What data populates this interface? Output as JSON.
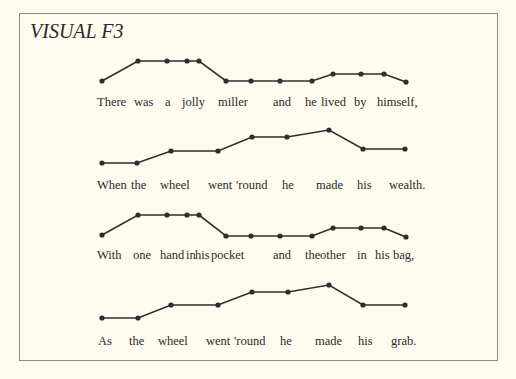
{
  "title": "VISUAL F3",
  "colors": {
    "background": "#fdfbed",
    "line": "#2e2e2e",
    "text": "#2b2b2b",
    "border": "#8a8a80"
  },
  "lines": [
    {
      "words": [
        {
          "text": "There",
          "x": 97
        },
        {
          "text": "was",
          "x": 134
        },
        {
          "text": "a",
          "x": 165
        },
        {
          "text": "jolly",
          "x": 182
        },
        {
          "text": "miller",
          "x": 218
        },
        {
          "text": "and",
          "x": 273
        },
        {
          "text": "he",
          "x": 305
        },
        {
          "text": "lived",
          "x": 321
        },
        {
          "text": "by",
          "x": 354
        },
        {
          "text": "himself,",
          "x": 377
        }
      ],
      "text_y": 95,
      "points": [
        [
          102,
          81
        ],
        [
          138,
          61
        ],
        [
          167,
          61
        ],
        [
          187,
          61
        ],
        [
          199,
          61
        ],
        [
          226,
          81
        ],
        [
          251,
          81
        ],
        [
          280,
          81
        ],
        [
          312,
          81
        ],
        [
          333,
          74
        ],
        [
          361,
          74
        ],
        [
          384,
          74
        ],
        [
          406,
          82
        ]
      ]
    },
    {
      "words": [
        {
          "text": "When",
          "x": 97
        },
        {
          "text": "the",
          "x": 131
        },
        {
          "text": "wheel",
          "x": 160
        },
        {
          "text": "went",
          "x": 208
        },
        {
          "text": "'round",
          "x": 236
        },
        {
          "text": "he",
          "x": 282
        },
        {
          "text": "made",
          "x": 316
        },
        {
          "text": "his",
          "x": 357
        },
        {
          "text": "wealth.",
          "x": 389
        }
      ],
      "text_y": 178,
      "points": [
        [
          102,
          163
        ],
        [
          137,
          163
        ],
        [
          171,
          151
        ],
        [
          218,
          151
        ],
        [
          252,
          137
        ],
        [
          287,
          137
        ],
        [
          329,
          130
        ],
        [
          363,
          149
        ],
        [
          405,
          149
        ]
      ]
    },
    {
      "words": [
        {
          "text": "With",
          "x": 97
        },
        {
          "text": "one",
          "x": 133
        },
        {
          "text": "hand",
          "x": 160
        },
        {
          "text": "in",
          "x": 186
        },
        {
          "text": "his",
          "x": 195
        },
        {
          "text": "pocket",
          "x": 211
        },
        {
          "text": "and",
          "x": 273
        },
        {
          "text": "the",
          "x": 305
        },
        {
          "text": "other",
          "x": 320
        },
        {
          "text": "in",
          "x": 357
        },
        {
          "text": "his",
          "x": 375
        },
        {
          "text": "bag,",
          "x": 393
        }
      ],
      "text_y": 248,
      "points": [
        [
          102,
          235
        ],
        [
          138,
          215
        ],
        [
          167,
          215
        ],
        [
          187,
          215
        ],
        [
          199,
          215
        ],
        [
          226,
          236
        ],
        [
          251,
          236
        ],
        [
          280,
          236
        ],
        [
          312,
          236
        ],
        [
          333,
          228
        ],
        [
          361,
          228
        ],
        [
          384,
          228
        ],
        [
          406,
          237
        ]
      ]
    },
    {
      "words": [
        {
          "text": "As",
          "x": 98
        },
        {
          "text": "the",
          "x": 129
        },
        {
          "text": "wheel",
          "x": 158
        },
        {
          "text": "went",
          "x": 206
        },
        {
          "text": "'round",
          "x": 234
        },
        {
          "text": "he",
          "x": 280
        },
        {
          "text": "made",
          "x": 315
        },
        {
          "text": "his",
          "x": 358
        },
        {
          "text": "grab.",
          "x": 391
        }
      ],
      "text_y": 334,
      "points": [
        [
          102,
          318
        ],
        [
          138,
          318
        ],
        [
          171,
          305
        ],
        [
          218,
          305
        ],
        [
          252,
          292
        ],
        [
          288,
          292
        ],
        [
          329,
          285
        ],
        [
          363,
          305
        ],
        [
          405,
          305
        ]
      ]
    }
  ]
}
